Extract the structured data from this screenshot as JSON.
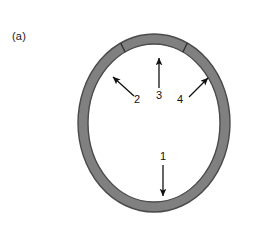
{
  "figure": {
    "panel_label": "(a)",
    "background_color": "#ffffff",
    "ring": {
      "name": "annulus",
      "fill_color": "#808080",
      "stroke_color": "#4a4a4a",
      "interior_color": "#ffffff",
      "center_x": 154,
      "center_y": 123,
      "outer_radius_x": 76,
      "outer_radius_y": 89,
      "thickness": 10,
      "segment_divider_angles_deg": [
        -116,
        -64
      ]
    },
    "annotations": [
      {
        "id": "1",
        "label": "1",
        "direction": "down",
        "tail_x": 163,
        "tail_y": 165,
        "head_x": 163,
        "head_y": 196,
        "label_x": 163,
        "label_y": 160
      },
      {
        "id": "2",
        "label": "2",
        "direction": "up-left",
        "tail_x": 134,
        "tail_y": 96,
        "head_x": 113,
        "head_y": 77,
        "label_x": 137,
        "label_y": 103
      },
      {
        "id": "3",
        "label": "3",
        "direction": "up",
        "tail_x": 159,
        "tail_y": 88,
        "head_x": 159,
        "head_y": 58,
        "label_x": 159,
        "label_y": 99
      },
      {
        "id": "4",
        "label": "4",
        "direction": "up-right",
        "tail_x": 189,
        "tail_y": 97,
        "head_x": 208,
        "head_y": 78,
        "label_x": 180,
        "label_y": 103
      }
    ]
  }
}
